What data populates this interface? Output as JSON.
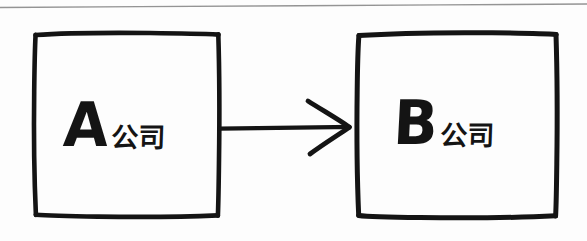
{
  "diagram": {
    "type": "flow-diagram",
    "style": "hand-drawn",
    "background_color": "#fdfdfd",
    "ink_color": "#141414",
    "page_rule_color": "#8a8a8a",
    "nodes": [
      {
        "id": "node-a",
        "letter": "A",
        "suffix": "公司",
        "full_label": "A公司",
        "shape": "square",
        "box": {
          "x": 34,
          "y": 33,
          "width": 185,
          "height": 183
        }
      },
      {
        "id": "node-b",
        "letter": "B",
        "suffix": "公司",
        "full_label": "B公司",
        "shape": "square",
        "box": {
          "x": 358,
          "y": 33,
          "width": 198,
          "height": 183
        }
      }
    ],
    "edges": [
      {
        "id": "edge-a-to-b",
        "from": "node-a",
        "to": "node-b",
        "label": "",
        "arrow_head": "open-chevron",
        "direction": "right",
        "start_x": 219,
        "end_x": 350,
        "y": 128
      }
    ],
    "page_rule": {
      "visible": true,
      "left_y": 7,
      "right_y": 4
    }
  }
}
